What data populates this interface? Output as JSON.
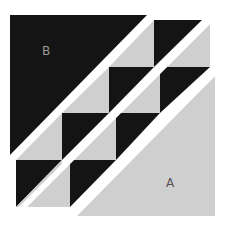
{
  "diagram": {
    "colors": {
      "dark": "#141414",
      "light": "#cfcfcf",
      "gap": "#ffffff",
      "label_on_dark": "#9a9a9a",
      "label_on_light": "#555555"
    },
    "labels": {
      "b": "B",
      "a": "A"
    },
    "pieces": {
      "triangle_b": "10,15 147,15 10,155",
      "triangle_a": "215,76 215,216 77,216",
      "strip1_dark": [
        "154,20 202,20 154,67",
        "109,67 154,67 109,113",
        "62,113 109,113 62,160",
        "16,160 62,160 16,207"
      ],
      "strip1_light": [
        "109,67 154,20 154,67",
        "62,113 109,67 109,113",
        "16,160 62,113 62,160",
        "16,207 62,160 62,207"
      ],
      "strip2_dark": [
        "160,67 210,67 160,113",
        "116,113 160,113 116,160",
        "70,160 116,160 70,207"
      ],
      "strip2_light": [
        "160,67 210,20 210,67",
        "116,113 160,67 160,113",
        "70,160 116,113 116,160",
        "25,207 70,160 70,207"
      ]
    }
  }
}
